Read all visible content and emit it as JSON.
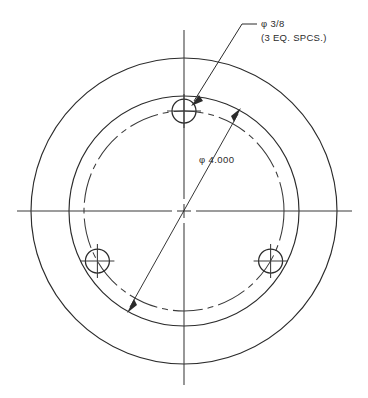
{
  "drawing": {
    "title": "Bolt Circle Hole Pattern Detail",
    "view_name": "front-view",
    "line_color": "#2b2b2b",
    "centerline_color": "#3a3a3a",
    "background_color": "#ffffff"
  },
  "geometry": {
    "center": {
      "x": 184,
      "y": 211
    },
    "outer_circle": {
      "radius": 153,
      "label": "outer-circle"
    },
    "inner_circle": {
      "radius": 115,
      "label": "inner-circle"
    },
    "bolt_circle": {
      "radius": 100,
      "label": "bolt-circle",
      "style": "centerline"
    },
    "holes": [
      {
        "id": "hole-top",
        "angle_deg": 90,
        "cx": 184,
        "cy": 111,
        "radius": 12
      },
      {
        "id": "hole-lower-left",
        "angle_deg": 210,
        "cx": 97.4,
        "cy": 261,
        "radius": 12
      },
      {
        "id": "hole-lower-right",
        "angle_deg": 330,
        "cx": 270.6,
        "cy": 261,
        "radius": 12
      }
    ],
    "centerlines": {
      "horizontal": {
        "x1": 17,
        "x2": 352,
        "y": 211
      },
      "vertical": {
        "y1": 30,
        "y2": 385,
        "x": 184
      }
    }
  },
  "annotations": {
    "hole_callout": {
      "name": "hole-size-callout",
      "line1": "φ 3/8",
      "line2": "(3 EQ. SPCS.)",
      "text_x": 261,
      "text_y_line1": 27,
      "text_y_line2": 41,
      "leader": {
        "shoulder_x1": 256,
        "shoulder_x2": 242,
        "shoulder_y": 24,
        "elbow_x": 242,
        "elbow_y": 24,
        "tip_x": 193,
        "tip_y": 102
      }
    },
    "diameter_dimension": {
      "name": "bolt-circle-diameter",
      "text": "φ 4.000",
      "text_x": 199,
      "text_y": 163,
      "line": {
        "x1": 240,
        "y1": 111,
        "x2": 128,
        "y2": 310
      }
    }
  }
}
